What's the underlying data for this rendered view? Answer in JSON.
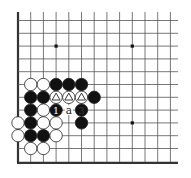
{
  "board": {
    "cols": 13,
    "rows": 12,
    "origin_x": 18,
    "origin_y": 20.5,
    "spacing_x": 12.7,
    "spacing_y": 12.8,
    "line_top": 12,
    "line_right": 178,
    "colors": {
      "line": "#555555",
      "border": "#333333",
      "black_stone": "#111111",
      "white_stone": "#ffffff",
      "stone_outline": "#222222",
      "background": "#ffffff"
    },
    "star_points": [
      [
        3,
        2
      ],
      [
        9,
        2
      ],
      [
        9,
        8
      ]
    ],
    "stones": [
      {
        "col": 1,
        "row": 5,
        "color": "white"
      },
      {
        "col": 2,
        "row": 5,
        "color": "white"
      },
      {
        "col": 3,
        "row": 5,
        "color": "black"
      },
      {
        "col": 4,
        "row": 5,
        "color": "black"
      },
      {
        "col": 5,
        "row": 5,
        "color": "black"
      },
      {
        "col": 1,
        "row": 6,
        "color": "black"
      },
      {
        "col": 2,
        "row": 6,
        "color": "black"
      },
      {
        "col": 3,
        "row": 6,
        "color": "white",
        "mark": "triangle"
      },
      {
        "col": 4,
        "row": 6,
        "color": "white",
        "mark": "triangle"
      },
      {
        "col": 5,
        "row": 6,
        "color": "white",
        "mark": "triangle"
      },
      {
        "col": 6,
        "row": 6,
        "color": "black"
      },
      {
        "col": 1,
        "row": 7,
        "color": "black"
      },
      {
        "col": 2,
        "row": 7,
        "color": "white"
      },
      {
        "col": 3,
        "row": 7,
        "color": "black",
        "label": "1"
      },
      {
        "col": 5,
        "row": 7,
        "color": "black",
        "label": "3"
      },
      {
        "col": 0,
        "row": 8,
        "color": "white"
      },
      {
        "col": 1,
        "row": 8,
        "color": "black"
      },
      {
        "col": 2,
        "row": 8,
        "color": "white"
      },
      {
        "col": 3,
        "row": 8,
        "color": "white"
      },
      {
        "col": 5,
        "row": 8,
        "color": "black"
      },
      {
        "col": 0,
        "row": 9,
        "color": "white"
      },
      {
        "col": 1,
        "row": 9,
        "color": "black"
      },
      {
        "col": 2,
        "row": 9,
        "color": "black"
      },
      {
        "col": 3,
        "row": 9,
        "color": "white"
      },
      {
        "col": 1,
        "row": 10,
        "color": "white"
      },
      {
        "col": 2,
        "row": 10,
        "color": "white"
      }
    ],
    "point_labels": [
      {
        "col": 4,
        "row": 7,
        "text": "a"
      }
    ]
  }
}
